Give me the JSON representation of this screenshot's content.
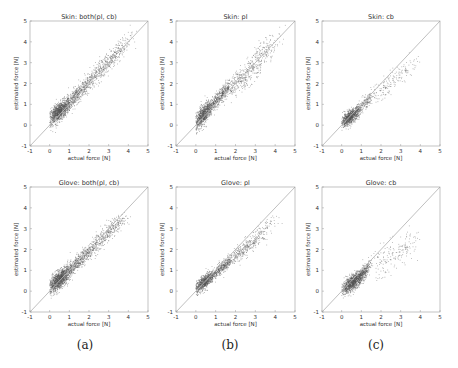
{
  "figure": {
    "captions": [
      "(a)",
      "(b)",
      "(c)"
    ],
    "caption_x": [
      85,
      230,
      376
    ]
  },
  "colors": {
    "points": "#555555",
    "identity_line": "#b8b8b8",
    "axes": "#9a9a9a",
    "text": "#333333"
  },
  "chart_data": [
    {
      "type": "scatter",
      "title": "Skin: both(pl, cb)",
      "xlabel": "actual force [N]",
      "ylabel": "estimated force [N]",
      "xlim": [
        -1,
        5
      ],
      "ylim": [
        -1,
        5
      ],
      "xticks": [
        -1,
        0,
        1,
        2,
        3,
        4,
        5
      ],
      "yticks": [
        -1,
        0,
        1,
        2,
        3,
        4,
        5
      ],
      "grid": false,
      "reference_line": "y = x",
      "panel": {
        "left": 30,
        "top": 21,
        "right": 148,
        "bottom": 146
      },
      "clusters": [
        {
          "cx": 0.45,
          "cy": 0.65,
          "sx": 0.3,
          "sy": 0.3,
          "corr": 0.7,
          "n": 1100
        },
        {
          "cx": 1.4,
          "cy": 1.5,
          "sx": 0.45,
          "sy": 0.45,
          "corr": 0.9,
          "n": 500
        },
        {
          "cx": 2.8,
          "cy": 2.9,
          "sx": 0.55,
          "sy": 0.55,
          "corr": 0.88,
          "n": 350
        },
        {
          "cx": 3.6,
          "cy": 3.8,
          "sx": 0.3,
          "sy": 0.35,
          "corr": 0.8,
          "n": 80
        }
      ]
    },
    {
      "type": "scatter",
      "title": "Skin: pl",
      "xlabel": "actual force [N]",
      "ylabel": "estimated force [N]",
      "xlim": [
        -1,
        5
      ],
      "ylim": [
        -1,
        5
      ],
      "xticks": [
        -1,
        0,
        1,
        2,
        3,
        4,
        5
      ],
      "yticks": [
        -1,
        0,
        1,
        2,
        3,
        4,
        5
      ],
      "grid": false,
      "reference_line": "y = x",
      "panel": {
        "left": 176,
        "top": 21,
        "right": 295,
        "bottom": 146
      },
      "clusters": [
        {
          "cx": 0.35,
          "cy": 0.5,
          "sx": 0.25,
          "sy": 0.35,
          "corr": 0.75,
          "n": 900
        },
        {
          "cx": 1.2,
          "cy": 1.4,
          "sx": 0.35,
          "sy": 0.4,
          "corr": 0.9,
          "n": 450
        },
        {
          "cx": 2.5,
          "cy": 2.4,
          "sx": 0.55,
          "sy": 0.55,
          "corr": 0.85,
          "n": 350
        },
        {
          "cx": 3.5,
          "cy": 3.7,
          "sx": 0.4,
          "sy": 0.4,
          "corr": 0.75,
          "n": 120
        }
      ]
    },
    {
      "type": "scatter",
      "title": "Skin: cb",
      "xlabel": "actual force [N]",
      "ylabel": "estimated force [N]",
      "xlim": [
        -1,
        5
      ],
      "ylim": [
        -1,
        5
      ],
      "xticks": [
        -1,
        0,
        1,
        2,
        3,
        4,
        5
      ],
      "yticks": [
        -1,
        0,
        1,
        2,
        3,
        4,
        5
      ],
      "grid": false,
      "reference_line": "y = x",
      "panel": {
        "left": 322,
        "top": 21,
        "right": 440,
        "bottom": 146
      },
      "clusters": [
        {
          "cx": 0.4,
          "cy": 0.4,
          "sx": 0.25,
          "sy": 0.22,
          "corr": 0.7,
          "n": 900
        },
        {
          "cx": 1.1,
          "cy": 1.0,
          "sx": 0.3,
          "sy": 0.3,
          "corr": 0.85,
          "n": 200
        },
        {
          "cx": 2.4,
          "cy": 2.0,
          "sx": 0.6,
          "sy": 0.5,
          "corr": 0.85,
          "n": 130
        },
        {
          "cx": 3.3,
          "cy": 2.8,
          "sx": 0.3,
          "sy": 0.3,
          "corr": 0.6,
          "n": 40
        }
      ]
    },
    {
      "type": "scatter",
      "title": "Glove: both(pl, cb)",
      "xlabel": "actual force [N]",
      "ylabel": "estimated force [N]",
      "xlim": [
        -1,
        5
      ],
      "ylim": [
        -1,
        5
      ],
      "xticks": [
        -1,
        0,
        1,
        2,
        3,
        4,
        5
      ],
      "yticks": [
        -1,
        0,
        1,
        2,
        3,
        4,
        5
      ],
      "grid": false,
      "reference_line": "y = x",
      "panel": {
        "left": 30,
        "top": 187,
        "right": 148,
        "bottom": 312
      },
      "clusters": [
        {
          "cx": 0.45,
          "cy": 0.55,
          "sx": 0.3,
          "sy": 0.3,
          "corr": 0.7,
          "n": 1200
        },
        {
          "cx": 1.4,
          "cy": 1.4,
          "sx": 0.45,
          "sy": 0.4,
          "corr": 0.9,
          "n": 500
        },
        {
          "cx": 2.6,
          "cy": 2.5,
          "sx": 0.5,
          "sy": 0.5,
          "corr": 0.88,
          "n": 300
        },
        {
          "cx": 3.3,
          "cy": 3.2,
          "sx": 0.3,
          "sy": 0.25,
          "corr": 0.6,
          "n": 120
        }
      ]
    },
    {
      "type": "scatter",
      "title": "Glove: pl",
      "xlabel": "actual force [N]",
      "ylabel": "estimated force [N]",
      "xlim": [
        -1,
        5
      ],
      "ylim": [
        -1,
        5
      ],
      "xticks": [
        -1,
        0,
        1,
        2,
        3,
        4,
        5
      ],
      "yticks": [
        -1,
        0,
        1,
        2,
        3,
        4,
        5
      ],
      "grid": false,
      "reference_line": "y = x",
      "panel": {
        "left": 176,
        "top": 187,
        "right": 295,
        "bottom": 312
      },
      "clusters": [
        {
          "cx": 0.4,
          "cy": 0.45,
          "sx": 0.25,
          "sy": 0.25,
          "corr": 0.75,
          "n": 800
        },
        {
          "cx": 1.3,
          "cy": 1.15,
          "sx": 0.35,
          "sy": 0.3,
          "corr": 0.9,
          "n": 400
        },
        {
          "cx": 2.4,
          "cy": 2.0,
          "sx": 0.45,
          "sy": 0.4,
          "corr": 0.85,
          "n": 280
        },
        {
          "cx": 3.4,
          "cy": 2.9,
          "sx": 0.3,
          "sy": 0.3,
          "corr": 0.7,
          "n": 90
        }
      ]
    },
    {
      "type": "scatter",
      "title": "Glove: cb",
      "xlabel": "actual force [N]",
      "ylabel": "estimated force [N]",
      "xlim": [
        -1,
        5
      ],
      "ylim": [
        -1,
        5
      ],
      "xticks": [
        -1,
        0,
        1,
        2,
        3,
        4,
        5
      ],
      "yticks": [
        -1,
        0,
        1,
        2,
        3,
        4,
        5
      ],
      "grid": false,
      "reference_line": "y = x",
      "panel": {
        "left": 322,
        "top": 187,
        "right": 440,
        "bottom": 312
      },
      "clusters": [
        {
          "cx": 0.55,
          "cy": 0.45,
          "sx": 0.3,
          "sy": 0.27,
          "corr": 0.75,
          "n": 1100
        },
        {
          "cx": 1.1,
          "cy": 0.9,
          "sx": 0.2,
          "sy": 0.25,
          "corr": 0.8,
          "n": 250
        },
        {
          "cx": 2.4,
          "cy": 1.6,
          "sx": 0.6,
          "sy": 0.5,
          "corr": 0.6,
          "n": 120
        },
        {
          "cx": 3.3,
          "cy": 2.3,
          "sx": 0.3,
          "sy": 0.35,
          "corr": 0.5,
          "n": 60
        }
      ]
    }
  ]
}
